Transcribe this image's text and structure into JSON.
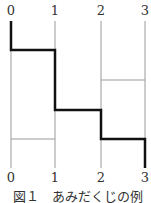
{
  "diagram": {
    "top_labels": [
      "0",
      "1",
      "2",
      "3"
    ],
    "bottom_labels": [
      "0",
      "1",
      "2",
      "3"
    ],
    "caption": "図１　あみだくじの例",
    "colors": {
      "thin_line": "#9a9a9a",
      "thick_path": "#111111",
      "text": "#333333"
    }
  }
}
